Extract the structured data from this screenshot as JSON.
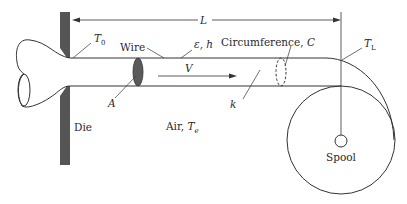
{
  "diagram": {
    "type": "wire-drawing-cooling-schematic",
    "labels": {
      "length": "L",
      "die_temp": "T",
      "die_temp_sub": "0",
      "end_temp": "T",
      "end_temp_sub": "L",
      "wire": "Wire",
      "emissivity_h": "ε, h",
      "circumference": "Circumference, ",
      "circumference_symbol": "C",
      "velocity": "V",
      "area": "A",
      "conductivity": "k",
      "air": "Air, ",
      "air_temp": "T",
      "air_temp_sub": "e",
      "die": "Die",
      "spool": "Spool"
    },
    "colors": {
      "line": "#333333",
      "die": "#555555",
      "cross_section": "#5a5a5a",
      "text": "#2a2a2a"
    }
  }
}
